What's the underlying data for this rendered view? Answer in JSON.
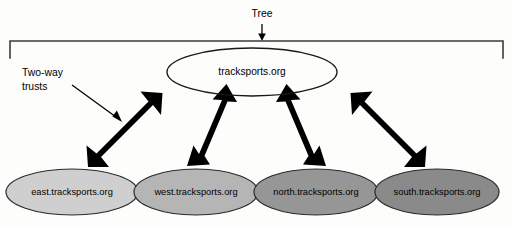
{
  "diagram": {
    "title_annotation": {
      "label": "Tree",
      "icon": "down-arrow-icon"
    },
    "trust_annotation": {
      "line1": "Two-way",
      "line2": "trusts",
      "icon": "diagonal-arrow-icon"
    },
    "root_node": {
      "label": "tracksports.org",
      "fill": "#ffffff",
      "stroke": "#1a1a1a"
    },
    "child_nodes": [
      {
        "label": "east.tracksports.org",
        "fill": "#cfcfcf",
        "stroke": "#2b2b2b",
        "arrow": "two-way-arrow-east"
      },
      {
        "label": "west.tracksports.org",
        "fill": "#b5b5b5",
        "stroke": "#2b2b2b",
        "arrow": "two-way-arrow-west"
      },
      {
        "label": "north.tracksports.org",
        "fill": "#969696",
        "stroke": "#2b2b2b",
        "arrow": "two-way-arrow-north"
      },
      {
        "label": "south.tracksports.org",
        "fill": "#8a8a8a",
        "stroke": "#2b2b2b",
        "arrow": "two-way-arrow-south"
      }
    ],
    "bracket": {
      "name": "tree-scope-bracket",
      "color": "#3b3b3b"
    },
    "arrow_color": "#000000"
  }
}
